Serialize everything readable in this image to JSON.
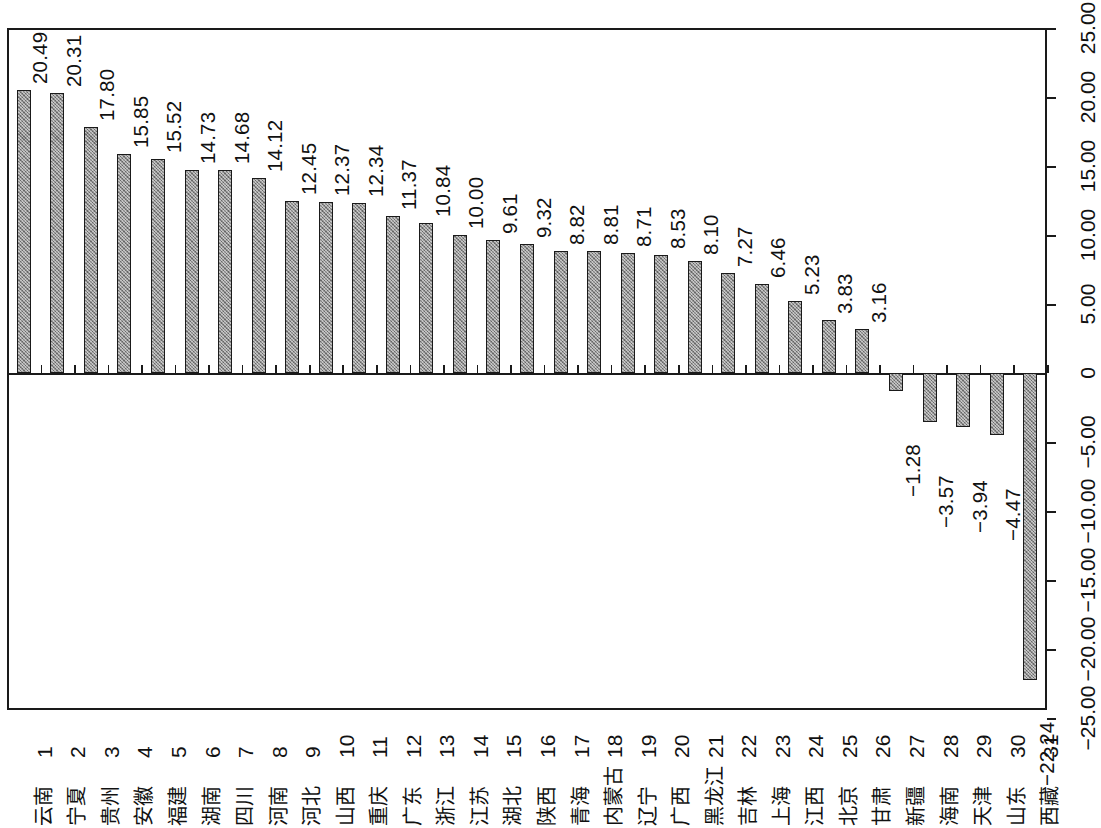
{
  "chart_data": {
    "type": "bar",
    "title": "",
    "subtitle": "",
    "xlabel": "",
    "ylabel": "",
    "orientation": "vertical-bars-rotated-labels",
    "grid": false,
    "legend": null,
    "ylim": [
      -25,
      25
    ],
    "ytick_labels": [
      "25.00",
      "20.00",
      "15.00",
      "10.00",
      "5.00",
      "0",
      "-5.00",
      "-10.00",
      "-15.00",
      "-20.00",
      "-25.00"
    ],
    "ytick_values": [
      25,
      20,
      15,
      10,
      5,
      0,
      -5,
      -10,
      -15,
      -20,
      -25
    ],
    "index_labels": [
      "1",
      "2",
      "3",
      "4",
      "5",
      "6",
      "7",
      "8",
      "9",
      "10",
      "11",
      "12",
      "13",
      "14",
      "15",
      "16",
      "17",
      "18",
      "19",
      "20",
      "21",
      "22",
      "23",
      "24",
      "25",
      "26",
      "27",
      "28",
      "29",
      "30",
      "31"
    ],
    "categories": [
      "云南",
      "宁夏",
      "贵州",
      "安徽",
      "福建",
      "湖南",
      "四川",
      "河南",
      "河北",
      "山西",
      "重庆",
      "广东",
      "浙江",
      "江苏",
      "湖北",
      "陕西",
      "青海",
      "内蒙古",
      "辽宁",
      "广西",
      "黑龙江",
      "吉林",
      "上海",
      "江西",
      "北京",
      "甘肃",
      "新疆",
      "海南",
      "天津",
      "山东",
      "西藏"
    ],
    "values": [
      20.49,
      20.31,
      17.8,
      15.85,
      15.52,
      14.73,
      14.68,
      14.12,
      12.45,
      12.37,
      12.34,
      11.37,
      10.84,
      10.0,
      9.61,
      9.32,
      8.82,
      8.81,
      8.71,
      8.53,
      8.1,
      7.27,
      6.46,
      5.23,
      3.83,
      3.16,
      -1.28,
      -3.57,
      -3.94,
      -4.47,
      -22.24
    ],
    "value_labels": [
      "20.49",
      "20.31",
      "17.80",
      "15.85",
      "15.52",
      "14.73",
      "14.68",
      "14.12",
      "12.45",
      "12.37",
      "12.34",
      "11.37",
      "10.84",
      "10.00",
      "9.61",
      "9.32",
      "8.82",
      "8.81",
      "8.71",
      "8.53",
      "8.10",
      "7.27",
      "6.46",
      "5.23",
      "3.83",
      "3.16",
      "−1.28",
      "−3.57",
      "−3.94",
      "−4.47",
      "−22.24"
    ],
    "colors": {
      "bar_fill": "#9a9a9a",
      "bar_border": "#1a1a1a",
      "axis": "#1a1a1a",
      "background": "#ffffff",
      "text": "#111111"
    }
  }
}
